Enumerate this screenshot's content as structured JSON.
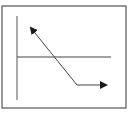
{
  "diagram": {
    "type": "line-arrow-diagram",
    "colors": {
      "background": "#ffffff",
      "frame": "#555555",
      "lines": "#444444",
      "arrowheads": "#1a1a1a"
    },
    "frame": {
      "x": 2,
      "y": 6,
      "width": 124,
      "height": 102
    },
    "vertical_axis": {
      "x": 17,
      "y1": 16,
      "y2": 100
    },
    "horizontal_line": {
      "y": 57,
      "x1": 17,
      "x2": 111
    },
    "arrow_path": {
      "points": [
        [
          31,
          28
        ],
        [
          77,
          85
        ],
        [
          106,
          85
        ]
      ],
      "start_arrowhead": true,
      "end_arrowhead": true
    }
  }
}
